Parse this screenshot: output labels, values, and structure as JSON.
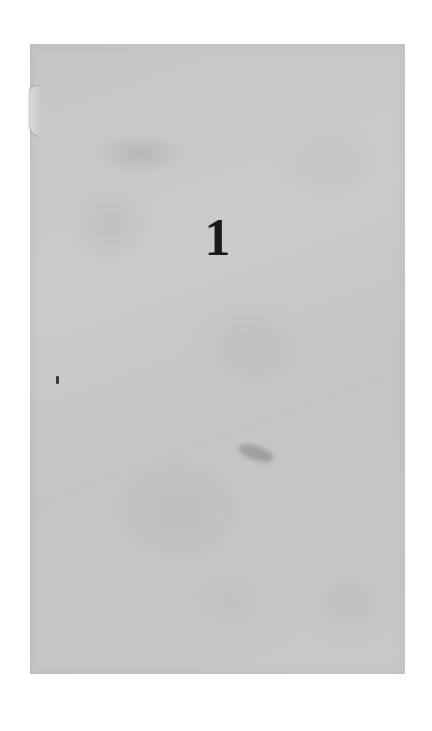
{
  "document": {
    "page_number": "1"
  },
  "colors": {
    "paper": "#c8c8c8",
    "background": "#ffffff",
    "ink": "#1a1a1a"
  }
}
